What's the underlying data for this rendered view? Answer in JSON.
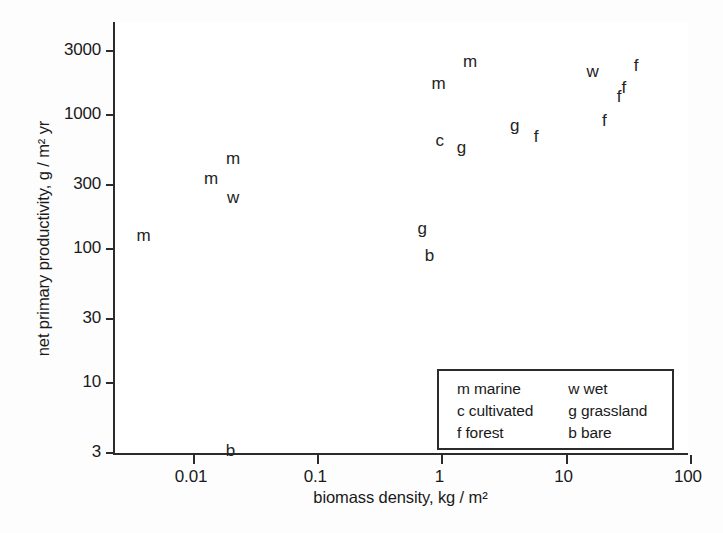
{
  "chart_data": {
    "type": "scatter",
    "title": "",
    "xlabel": "biomass density, kg / m²",
    "ylabel": "net primary productivity, g / m² yr",
    "xscale": "log",
    "yscale": "log",
    "xlim": [
      0.0032,
      100
    ],
    "ylim": [
      2.5,
      4600
    ],
    "grid": false,
    "legend_position": "bottom-right",
    "xticks": [
      {
        "value": 0.01,
        "label": "0.01"
      },
      {
        "value": 0.1,
        "label": "0.1"
      },
      {
        "value": 1,
        "label": "1"
      },
      {
        "value": 10,
        "label": "10"
      },
      {
        "value": 100,
        "label": "100"
      }
    ],
    "yticks": [
      {
        "value": 3000,
        "label": "3000"
      },
      {
        "value": 1000,
        "label": "1000"
      },
      {
        "value": 300,
        "label": "300"
      },
      {
        "value": 100,
        "label": "100"
      },
      {
        "value": 30,
        "label": "30"
      },
      {
        "value": 10,
        "label": "10"
      },
      {
        "value": 3,
        "label": "3"
      }
    ],
    "marker_style": "letter-code",
    "points": [
      {
        "code": "m",
        "category": "marine",
        "x": 0.004,
        "y": 125
      },
      {
        "code": "m",
        "category": "marine",
        "x": 0.014,
        "y": 330
      },
      {
        "code": "m",
        "category": "marine",
        "x": 0.021,
        "y": 470
      },
      {
        "code": "w",
        "category": "wet",
        "x": 0.021,
        "y": 240
      },
      {
        "code": "g",
        "category": "grassland",
        "x": 0.7,
        "y": 140
      },
      {
        "code": "b",
        "category": "bare",
        "x": 0.8,
        "y": 88
      },
      {
        "code": "b",
        "category": "bare",
        "x": 0.02,
        "y": 3.1
      },
      {
        "code": "m",
        "category": "marine",
        "x": 0.95,
        "y": 1700
      },
      {
        "code": "m",
        "category": "marine",
        "x": 1.7,
        "y": 2500
      },
      {
        "code": "c",
        "category": "cultivated",
        "x": 0.97,
        "y": 640
      },
      {
        "code": "g",
        "category": "grassland",
        "x": 1.45,
        "y": 570
      },
      {
        "code": "g",
        "category": "grassland",
        "x": 3.9,
        "y": 830
      },
      {
        "code": "f",
        "category": "forest",
        "x": 5.8,
        "y": 680
      },
      {
        "code": "w",
        "category": "wet",
        "x": 16.5,
        "y": 2100
      },
      {
        "code": "f",
        "category": "forest",
        "x": 20.5,
        "y": 900
      },
      {
        "code": "f",
        "category": "forest",
        "x": 27.0,
        "y": 1350
      },
      {
        "code": "f",
        "category": "forest",
        "x": 29.5,
        "y": 1600
      },
      {
        "code": "f",
        "category": "forest",
        "x": 37.0,
        "y": 2300
      }
    ],
    "legend": {
      "rows": [
        {
          "col1": "m marine",
          "col2": "w wet"
        },
        {
          "col1": "c cultivated",
          "col2": "g grassland"
        },
        {
          "col1": "f forest",
          "col2": "b bare"
        }
      ]
    }
  },
  "colors": {
    "ink": "#242424",
    "axis": "#2b2b2b",
    "background": "#fdfdfd",
    "plot_background": "#ffffff"
  }
}
